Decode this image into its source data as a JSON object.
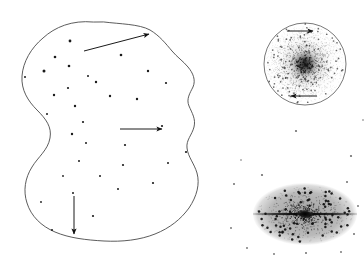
{
  "figure": {
    "background_color": "#ffffff",
    "width": 364,
    "height": 266
  },
  "colors": {
    "outline_stroke": "#4a4a4a",
    "circle_stroke": "#555555",
    "star_fill": "#1a1a1a",
    "faint_star_fill": "#6e6e6e",
    "ellipse_halo": "#b0b0b0",
    "dark_lane": "#0d0d0d",
    "arrow": "#111111"
  },
  "panels": [
    {
      "id": "protogalactic-cloud",
      "name": "Irregular protogalactic cloud",
      "shape": "irregular-blob",
      "arrows": 3
    },
    {
      "id": "spiral-galaxy",
      "name": "Face-on rotating disk galaxy",
      "shape": "circle",
      "arrows": 2
    },
    {
      "id": "elliptical-galaxy",
      "name": "Edge-on galaxy with dust lane",
      "shape": "ellipse",
      "arrows": 0
    }
  ],
  "cloud": {
    "outline_path": "M 93 22 C 72 20 55 27 43 38 C 31 48 23 62 22 76 C 21 90 28 101 37 110 C 46 119 52 127 50 138 C 48 150 38 157 32 167 C 25 178 23 191 27 203 C 31 216 41 226 55 232 C 69 238 86 240 104 241 C 122 242 140 240 155 234 C 170 228 181 219 189 208 C 197 196 200 184 197 173 C 194 163 188 157 187 148 C 186 140 192 135 194 127 C 196 119 192 113 189 106 C 186 99 190 93 193 87 C 196 80 193 73 188 67 C 183 61 177 57 172 51 C 166 44 160 36 150 30 C 139 24 120 24 104 22 Z",
    "stars": [
      {
        "x": 44,
        "y": 71,
        "r": 1.5
      },
      {
        "x": 25,
        "y": 77,
        "r": 1.0
      },
      {
        "x": 55,
        "y": 57,
        "r": 1.3
      },
      {
        "x": 70,
        "y": 41,
        "r": 1.4
      },
      {
        "x": 69,
        "y": 66,
        "r": 1.3
      },
      {
        "x": 68,
        "y": 88,
        "r": 1.1
      },
      {
        "x": 54,
        "y": 95,
        "r": 1.2
      },
      {
        "x": 75,
        "y": 106,
        "r": 1.2
      },
      {
        "x": 47,
        "y": 114,
        "r": 1.0
      },
      {
        "x": 72,
        "y": 134,
        "r": 1.2
      },
      {
        "x": 88,
        "y": 76,
        "r": 1.0
      },
      {
        "x": 96,
        "y": 82,
        "r": 1.2
      },
      {
        "x": 83,
        "y": 122,
        "r": 1.1
      },
      {
        "x": 110,
        "y": 96,
        "r": 1.2
      },
      {
        "x": 121,
        "y": 55,
        "r": 1.3
      },
      {
        "x": 148,
        "y": 71,
        "r": 1.2
      },
      {
        "x": 137,
        "y": 99,
        "r": 1.2
      },
      {
        "x": 166,
        "y": 83,
        "r": 1.1
      },
      {
        "x": 162,
        "y": 126,
        "r": 1.1
      },
      {
        "x": 125,
        "y": 145,
        "r": 1.1
      },
      {
        "x": 123,
        "y": 165,
        "r": 1.1
      },
      {
        "x": 86,
        "y": 143,
        "r": 1.0
      },
      {
        "x": 79,
        "y": 161,
        "r": 1.0
      },
      {
        "x": 186,
        "y": 152,
        "r": 1.1
      },
      {
        "x": 153,
        "y": 183,
        "r": 1.1
      },
      {
        "x": 73,
        "y": 193,
        "r": 1.0
      },
      {
        "x": 93,
        "y": 216,
        "r": 1.1
      },
      {
        "x": 52,
        "y": 230,
        "r": 1.0
      },
      {
        "x": 118,
        "y": 189,
        "r": 1.0
      },
      {
        "x": 168,
        "y": 163,
        "r": 1.0
      },
      {
        "x": 100,
        "y": 176,
        "r": 1.0
      },
      {
        "x": 63,
        "y": 176,
        "r": 0.9
      },
      {
        "x": 41,
        "y": 202,
        "r": 0.9
      }
    ],
    "arrows": [
      {
        "name": "arrow-upper-right",
        "x1": 84,
        "y1": 51,
        "x2": 149,
        "y2": 34,
        "direction": "up-right"
      },
      {
        "name": "arrow-middle-right",
        "x1": 120,
        "y1": 129,
        "x2": 162,
        "y2": 129,
        "direction": "right"
      },
      {
        "name": "arrow-lower-down",
        "x1": 74,
        "y1": 196,
        "x2": 74,
        "y2": 234,
        "direction": "down"
      }
    ]
  },
  "spiral": {
    "center_x": 305,
    "center_y": 64,
    "radius": 41,
    "core_radius": 10,
    "arrows": [
      {
        "name": "arrow-rotation-top",
        "x1": 287,
        "y1": 31,
        "x2": 313,
        "y2": 31,
        "direction": "right"
      },
      {
        "name": "arrow-rotation-bottom",
        "x1": 317,
        "y1": 96,
        "x2": 291,
        "y2": 96,
        "direction": "left"
      }
    ]
  },
  "elliptical": {
    "center_x": 305,
    "center_y": 214,
    "radius_x": 52,
    "radius_y": 31,
    "lane_half_length": 52,
    "lane_thickness": 2.2,
    "core_radius_x": 9,
    "core_radius_y": 5
  },
  "field_stars": [
    {
      "x": 296,
      "y": 131,
      "r": 1.1
    },
    {
      "x": 351,
      "y": 156,
      "r": 1.1
    },
    {
      "x": 234,
      "y": 184,
      "r": 1.0
    },
    {
      "x": 262,
      "y": 175,
      "r": 1.1
    },
    {
      "x": 347,
      "y": 182,
      "r": 1.0
    },
    {
      "x": 358,
      "y": 206,
      "r": 0.9
    },
    {
      "x": 354,
      "y": 234,
      "r": 1.0
    },
    {
      "x": 247,
      "y": 248,
      "r": 0.9
    },
    {
      "x": 306,
      "y": 253,
      "r": 1.0
    },
    {
      "x": 341,
      "y": 252,
      "r": 0.9
    },
    {
      "x": 274,
      "y": 254,
      "r": 0.9
    },
    {
      "x": 231,
      "y": 228,
      "r": 0.9
    },
    {
      "x": 241,
      "y": 160,
      "r": 0.8
    },
    {
      "x": 363,
      "y": 120,
      "r": 0.8
    }
  ]
}
